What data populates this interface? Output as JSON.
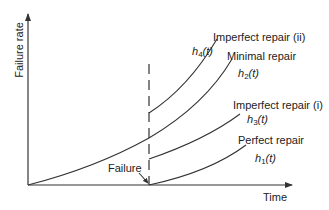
{
  "diagram": {
    "axes": {
      "y_label": "Failure rate",
      "x_label": "Time"
    },
    "event": {
      "label": "Failure"
    },
    "curves": [
      {
        "id": "h4",
        "name": "Imperfect repair (ii)",
        "fn_base": "h",
        "fn_sub": "4",
        "fn_arg": "(t)"
      },
      {
        "id": "h2",
        "name": "Minimal repair",
        "fn_base": "h",
        "fn_sub": "2",
        "fn_arg": "(t)"
      },
      {
        "id": "h3",
        "name": "Imperfect repair (i)",
        "fn_base": "h",
        "fn_sub": "3",
        "fn_arg": "(t)"
      },
      {
        "id": "h1",
        "name": "Perfect repair",
        "fn_base": "h",
        "fn_sub": "1",
        "fn_arg": "(t)"
      }
    ],
    "colors": {
      "line": "#333333",
      "background": "#ffffff"
    }
  }
}
